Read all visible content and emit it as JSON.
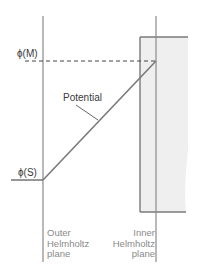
{
  "diagram": {
    "labels": {
      "phi_m": "ϕ(M)",
      "phi_s": "ϕ(S)",
      "potential": "Potential"
    },
    "planes": {
      "outer": [
        "Outer",
        "Helmholtz",
        "plane"
      ],
      "inner": [
        "Inner",
        "Helmholtz",
        "plane"
      ]
    },
    "colors": {
      "line": "#7a7a7a",
      "electrode_fill": "#eeeeee",
      "dashed": "#444444",
      "plane_text": "#8a8a8a"
    }
  }
}
